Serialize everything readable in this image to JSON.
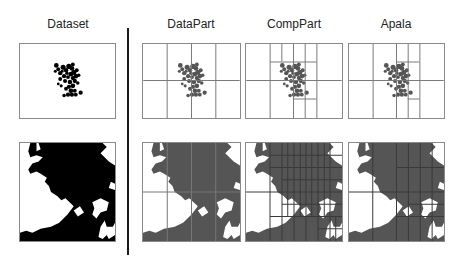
{
  "figure": {
    "columns": [
      {
        "id": "dataset",
        "title": "Dataset"
      },
      {
        "id": "datapart",
        "title": "DataPart"
      },
      {
        "id": "comppart",
        "title": "CompPart"
      },
      {
        "id": "apala",
        "title": "Apala"
      }
    ],
    "rows": [
      {
        "id": "sparse-cluster",
        "description": "scattered point cluster in center"
      },
      {
        "id": "dense-map",
        "description": "dense coastline-like region"
      }
    ],
    "colors": {
      "dataset_fill": "#000000",
      "partition_fill": "#555555",
      "grid_line": "#777777",
      "border": "#8a8a8a"
    }
  }
}
